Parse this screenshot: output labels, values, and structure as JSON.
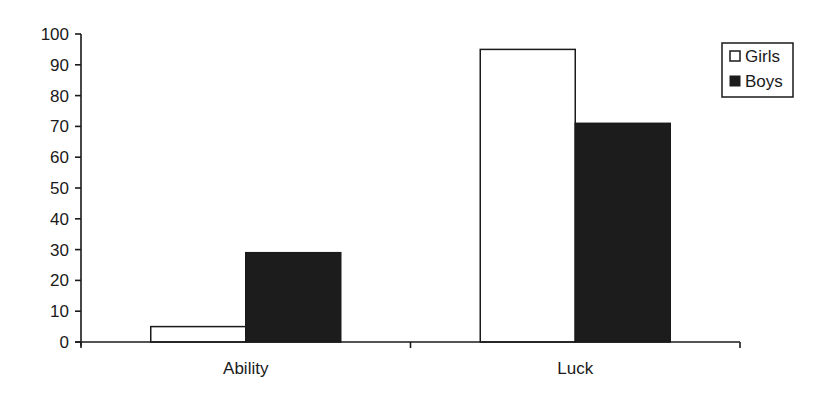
{
  "chart_data": {
    "type": "bar",
    "title": "",
    "xlabel": "",
    "ylabel": "",
    "categories": [
      "Ability",
      "Luck"
    ],
    "series": [
      {
        "name": "Girls",
        "values": [
          5,
          95
        ],
        "fill": "#ffffff",
        "stroke": "#1a1a1a"
      },
      {
        "name": "Boys",
        "values": [
          29,
          71
        ],
        "fill": "#1c1c1c",
        "stroke": "#1a1a1a"
      }
    ],
    "ylim": [
      0,
      100
    ],
    "yticks": [
      0,
      10,
      20,
      30,
      40,
      50,
      60,
      70,
      80,
      90,
      100
    ],
    "grid": false,
    "legend_position": "top-right"
  },
  "legend": {
    "items": [
      {
        "label": "Girls",
        "swatch": "open-square"
      },
      {
        "label": "Boys",
        "swatch": "filled-square"
      }
    ]
  },
  "colors": {
    "axis": "#1a1a1a",
    "girls_fill": "#ffffff",
    "boys_fill": "#1c1c1c",
    "background": "#ffffff"
  }
}
